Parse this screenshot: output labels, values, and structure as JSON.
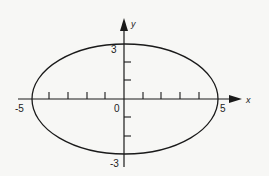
{
  "diagram": {
    "type": "ellipse-plot",
    "equation_shape": "ellipse centered at origin",
    "semi_major_axis": 5,
    "semi_minor_axis": 3,
    "axes": {
      "x_label": "x",
      "y_label": "y",
      "origin_label": "0"
    },
    "labels": {
      "x_min": "-5",
      "x_max": "5",
      "y_max": "3",
      "y_min": "-3"
    },
    "x_ticks": [
      -4,
      -3,
      -2,
      -1,
      1,
      2,
      3,
      4
    ],
    "y_ticks": [
      -2,
      -1,
      1,
      2
    ],
    "colors": {
      "stroke": "#1a1a1a",
      "background": "#f7f7f5"
    }
  }
}
